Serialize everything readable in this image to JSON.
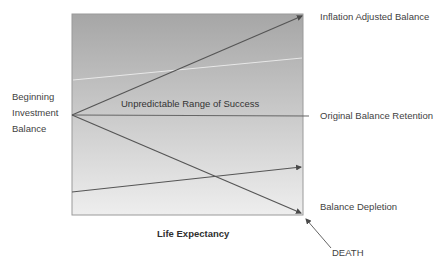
{
  "diagram": {
    "type": "retirement-balance-range",
    "plot_area": {
      "gradient_top": "#a6a6a6",
      "gradient_bottom": "#eeeeee",
      "border": "#9a9a9a"
    },
    "line_color": "#5a5a5a",
    "labels": {
      "y_origin": [
        "Beginning",
        "Investment",
        "Balance"
      ],
      "center": "Unpredictable Range of Success",
      "top_right": "Inflation Adjusted Balance",
      "middle_right": "Original Balance Retention",
      "bottom_right": "Balance Depletion",
      "x_axis": "Life Expectancy",
      "endpoint": "DEATH"
    },
    "lines": [
      {
        "name": "inflation-adjusted-line",
        "from": [
          72,
          115
        ],
        "to": [
          303,
          15
        ]
      },
      {
        "name": "original-retention-line",
        "from": [
          72,
          115
        ],
        "to": [
          309,
          116
        ]
      },
      {
        "name": "depletion-line",
        "from": [
          72,
          115
        ],
        "to": [
          302,
          214
        ]
      },
      {
        "name": "lower-growth-line",
        "from": [
          72,
          192
        ],
        "to": [
          302,
          167
        ]
      }
    ]
  }
}
